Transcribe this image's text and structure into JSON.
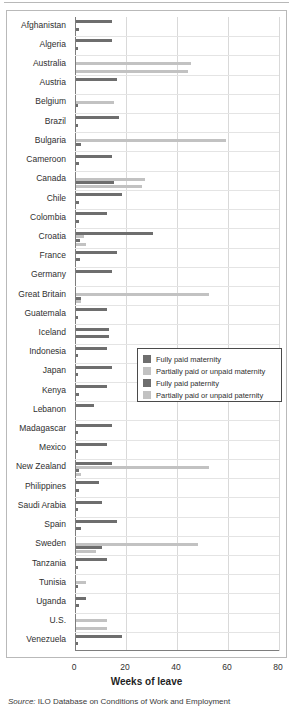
{
  "chart": {
    "xlabel": "Weeks of leave",
    "source_label": "Source:",
    "source_text": " ILO Database on Conditions of Work and Employment"
  },
  "legend": {
    "items": [
      {
        "label": "Fully paid maternity",
        "color": "#6e6e6e",
        "key": "fully_paid_maternity"
      },
      {
        "label": "Partially paid or unpaid maternity",
        "color": "#c2c2c2",
        "key": "partially_paid_maternity"
      },
      {
        "label": "Fully paid paternity",
        "color": "#6e6e6e",
        "key": "fully_paid_paternity"
      },
      {
        "label": "Partially paid or unpaid paternity",
        "color": "#c2c2c2",
        "key": "partially_paid_paternity"
      }
    ]
  },
  "chart_data": {
    "type": "bar",
    "orientation": "horizontal",
    "grouped": true,
    "title": "",
    "xlabel": "Weeks of leave",
    "ylabel": "",
    "xlim": [
      0,
      80
    ],
    "xticks": [
      0,
      20,
      40,
      60,
      80
    ],
    "grid": "vertical",
    "legend_position": "center-right",
    "series_names": [
      "Fully paid maternity",
      "Partially paid or unpaid maternity",
      "Fully paid paternity",
      "Partially paid or unpaid paternity"
    ],
    "series_colors": [
      "#6e6e6e",
      "#c2c2c2",
      "#6e6e6e",
      "#c2c2c2"
    ],
    "categories": [
      "Afghanistan",
      "Algeria",
      "Australia",
      "Austria",
      "Belgium",
      "Brazil",
      "Bulgaria",
      "Cameroon",
      "Canada",
      "Chile",
      "Colombia",
      "Croatia",
      "France",
      "Germany",
      "Great Britain",
      "Guatemala",
      "Iceland",
      "Indonesia",
      "Japan",
      "Kenya",
      "Lebanon",
      "Madagascar",
      "Mexico",
      "New Zealand",
      "Philippines",
      "Saudi Arabia",
      "Spain",
      "Sweden",
      "Tanzania",
      "Tunisia",
      "Uganda",
      "U.S.",
      "Venezuela"
    ],
    "series": [
      {
        "name": "Fully paid maternity",
        "color": "#6e6e6e",
        "values": [
          14,
          14,
          0,
          16,
          0,
          17,
          0,
          14,
          0,
          18,
          12,
          30,
          16,
          14,
          0,
          12,
          13,
          12,
          14,
          12,
          7,
          14,
          12,
          14,
          9,
          10,
          16,
          0,
          12,
          0,
          4,
          0,
          18
        ]
      },
      {
        "name": "Partially paid or unpaid maternity",
        "color": "#c2c2c2",
        "values": [
          0,
          0,
          45,
          0,
          15,
          0,
          59,
          0,
          27,
          0,
          0,
          3,
          0,
          0,
          52,
          0,
          0,
          0,
          0,
          0,
          0,
          0,
          0,
          52,
          0,
          0,
          0,
          48,
          0,
          4,
          0,
          12,
          0
        ]
      },
      {
        "name": "Fully paid paternity",
        "color": "#6e6e6e",
        "values": [
          1,
          0.5,
          0,
          0,
          0.5,
          0.5,
          2,
          1,
          15,
          1,
          1,
          1.5,
          1.5,
          0,
          2,
          0.5,
          13,
          0.3,
          0.2,
          1,
          0,
          0.5,
          0.2,
          1,
          1,
          0.3,
          2,
          10,
          0.5,
          0.3,
          1,
          0,
          0.5
        ]
      },
      {
        "name": "Partially paid or unpaid paternity",
        "color": "#c2c2c2",
        "values": [
          0,
          0,
          44,
          0,
          0,
          0,
          0,
          0,
          26,
          0,
          0,
          4,
          0,
          0,
          2,
          0,
          0,
          0,
          0,
          0,
          0,
          0,
          0,
          2,
          0,
          0,
          0,
          8,
          0,
          0,
          0,
          12,
          0
        ]
      }
    ]
  }
}
